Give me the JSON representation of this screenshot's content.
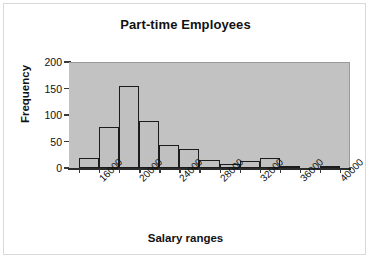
{
  "chart_data": {
    "type": "bar",
    "title": "Part-time Employees",
    "xlabel": "Salary ranges",
    "ylabel": "Frequency",
    "grid": false,
    "legend": "none",
    "ylim": [
      0,
      200
    ],
    "yticks": [
      0,
      50,
      100,
      150,
      200
    ],
    "ytick_labels": [
      "0",
      "50",
      "100",
      "150",
      "200"
    ],
    "xtick_labels": [
      "16000",
      "20000",
      "24000",
      "28000",
      "32000",
      "36000",
      "40000"
    ],
    "bin_width": 2000,
    "bin_starts": [
      14000,
      16000,
      18000,
      20000,
      22000,
      24000,
      26000,
      28000,
      30000,
      32000,
      34000,
      36000,
      38000
    ],
    "categories": [
      "14000",
      "16000",
      "18000",
      "20000",
      "22000",
      "24000",
      "26000",
      "28000",
      "30000",
      "32000",
      "34000",
      "36000",
      "38000"
    ],
    "values": [
      19,
      77,
      155,
      88,
      44,
      36,
      16,
      8,
      13,
      18,
      2,
      0,
      2
    ],
    "colors": {
      "bar_fill": "#c0c0c0",
      "bar_edge": "#1c1c1c",
      "plot_background": "#c2c2c2",
      "figure_background": "#ffffff",
      "axis": "#2b2b2b",
      "text": "#111111",
      "frame_border": "#d9d9d9"
    }
  }
}
